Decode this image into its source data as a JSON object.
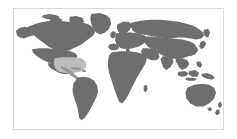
{
  "figure": {
    "name": "world-map-thumbnail",
    "type": "map",
    "projection": "equirectangular"
  },
  "frame": {
    "border_color": "#d9d9d9",
    "background_color": "#ffffff"
  },
  "map": {
    "ocean_color": "#ffffff",
    "land_color": "#6e6e6e",
    "highlight_color": "#bdbdbd",
    "highlight_land_color": "#9a9a9a",
    "highlighted_region_label": "Central America and Caribbean",
    "regions": [
      {
        "name": "north-america",
        "label": "North America"
      },
      {
        "name": "south-america",
        "label": "South America"
      },
      {
        "name": "europe",
        "label": "Europe"
      },
      {
        "name": "africa",
        "label": "Africa"
      },
      {
        "name": "asia",
        "label": "Asia"
      },
      {
        "name": "australia",
        "label": "Australia"
      },
      {
        "name": "new-zealand",
        "label": "New Zealand"
      },
      {
        "name": "greenland",
        "label": "Greenland"
      },
      {
        "name": "japan",
        "label": "Japan"
      },
      {
        "name": "madagascar",
        "label": "Madagascar"
      },
      {
        "name": "indonesia",
        "label": "Indonesia"
      },
      {
        "name": "united-kingdom",
        "label": "United Kingdom"
      },
      {
        "name": "central-america-caribbean",
        "label": "Central America and Caribbean"
      }
    ]
  }
}
